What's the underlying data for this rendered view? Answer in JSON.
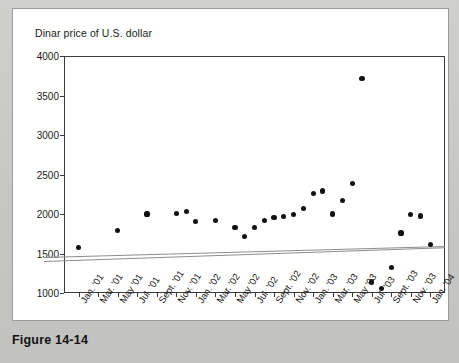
{
  "figure": {
    "caption": "Figure 14-14"
  },
  "chart_data": {
    "type": "scatter",
    "title": "Dinar price of U.S. dollar",
    "xlabel": "",
    "ylabel": "",
    "ylim": [
      1000,
      4000
    ],
    "y_ticks": [
      1000,
      1500,
      2000,
      2500,
      3000,
      3500,
      4000
    ],
    "y_tick_labels": [
      "1000",
      "1500",
      "2000",
      "2500",
      "3000",
      "3500",
      "4000"
    ],
    "grid": false,
    "legend": "none",
    "x_tick_labels": [
      "Jan. '01",
      "Mar. '01",
      "May '01",
      "Jul. '01",
      "Sept. '01",
      "Nov. '01",
      "Jan. '02",
      "Mar. '02",
      "May '02",
      "Jul. '02",
      "Sept. '02",
      "Nov. '02",
      "Jan. '03",
      "Mar. '03",
      "May '03",
      "Jul. '03",
      "Sept. '03",
      "Nov. '03",
      "Jan. '04"
    ],
    "x_tick_months": [
      0,
      2,
      4,
      6,
      8,
      10,
      12,
      14,
      16,
      18,
      20,
      22,
      24,
      26,
      28,
      30,
      32,
      34,
      36
    ],
    "xlim_months": [
      -1.5,
      37.5
    ],
    "series": [
      {
        "name": "Dinar price of U.S. dollar",
        "marker": "filled-circle",
        "color": "#111111",
        "points": [
          {
            "x_month": 0,
            "x_label": "Jan. '01",
            "y": 1580
          },
          {
            "x_month": 4,
            "x_label": "May '01",
            "y": 1790
          },
          {
            "x_month": 7,
            "x_label": "Aug. '01",
            "y": 2000
          },
          {
            "x_month": 10,
            "x_label": "Nov. '01",
            "y": 2010
          },
          {
            "x_month": 11,
            "x_label": "Dec. '01",
            "y": 2035
          },
          {
            "x_month": 12,
            "x_label": "Jan. '02",
            "y": 1900
          },
          {
            "x_month": 14,
            "x_label": "Mar. '02",
            "y": 1920
          },
          {
            "x_month": 16,
            "x_label": "May '02",
            "y": 1830
          },
          {
            "x_month": 17,
            "x_label": "Jun. '02",
            "y": 1720
          },
          {
            "x_month": 18,
            "x_label": "Jul. '02",
            "y": 1830
          },
          {
            "x_month": 19,
            "x_label": "Aug. '02",
            "y": 1920
          },
          {
            "x_month": 20,
            "x_label": "Sept. '02",
            "y": 1955
          },
          {
            "x_month": 21,
            "x_label": "Oct. '02",
            "y": 1970
          },
          {
            "x_month": 22,
            "x_label": "Nov. '02",
            "y": 1990
          },
          {
            "x_month": 23,
            "x_label": "Dec. '02",
            "y": 2070
          },
          {
            "x_month": 24,
            "x_label": "Jan. '03",
            "y": 2260
          },
          {
            "x_month": 25,
            "x_label": "Feb. '03",
            "y": 2290
          },
          {
            "x_month": 26,
            "x_label": "Mar. '03",
            "y": 2000
          },
          {
            "x_month": 27,
            "x_label": "Apr. '03",
            "y": 2170
          },
          {
            "x_month": 28,
            "x_label": "May '03",
            "y": 2390
          },
          {
            "x_month": 29,
            "x_label": "Jun. '03",
            "y": 3720
          },
          {
            "x_month": 30,
            "x_label": "Jul. '03",
            "y": 1140
          },
          {
            "x_month": 31,
            "x_label": "Aug. '03",
            "y": 1060
          },
          {
            "x_month": 32,
            "x_label": "Sept. '03",
            "y": 1320
          },
          {
            "x_month": 33,
            "x_label": "Oct. '03",
            "y": 1760
          },
          {
            "x_month": 34,
            "x_label": "Nov. '03",
            "y": 1990
          },
          {
            "x_month": 35,
            "x_label": "Dec. '03",
            "y": 1975
          },
          {
            "x_month": 36,
            "x_label": "Jan. '04",
            "y": 1615
          }
        ]
      }
    ],
    "trend_lines": [
      {
        "name": "trend-upper",
        "color": "#8d8d8d",
        "x_start_month": -3.5,
        "y_start": 1450,
        "x_end_month": 37.5,
        "y_end": 1590
      },
      {
        "name": "trend-lower",
        "color": "#8d8d8d",
        "x_start_month": -3.5,
        "y_start": 1405,
        "x_end_month": 37.5,
        "y_end": 1580
      }
    ]
  }
}
